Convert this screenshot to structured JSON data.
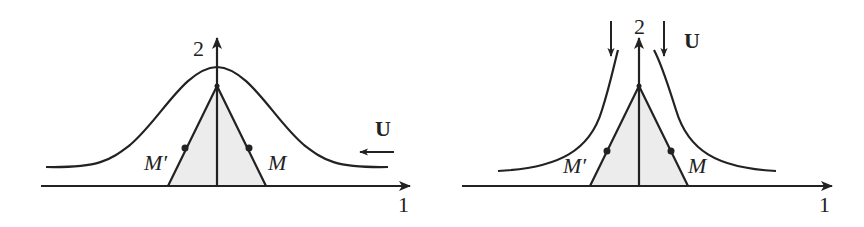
{
  "colors": {
    "stroke": "#222222",
    "fill_wedge": "#ececec",
    "background": "#ffffff"
  },
  "panels": [
    {
      "id": "left",
      "description": "Uniform flow U from right to left past a wedge, streamline bulging over the wedge",
      "axis_x_label": "1",
      "axis_y_label": "2",
      "point_right_label": "M",
      "point_left_label": "M′",
      "flow_label": "U",
      "flow_direction": "left"
    },
    {
      "id": "right",
      "description": "Flow U directed downward toward a wedge, hyperbolic streamlines turning outward",
      "axis_x_label": "1",
      "axis_y_label": "2",
      "point_right_label": "M",
      "point_left_label": "M′",
      "flow_label": "U",
      "flow_direction": "down"
    }
  ]
}
